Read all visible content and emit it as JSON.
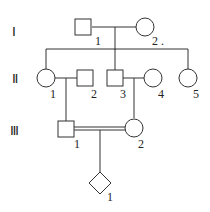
{
  "generations": {
    "g1": "Ⅰ",
    "g2": "Ⅱ",
    "g3": "Ⅲ"
  },
  "individuals": {
    "I_1": {
      "label": "1",
      "sex": "male"
    },
    "I_2": {
      "label": "2",
      "sex": "female"
    },
    "II_1": {
      "label": "1",
      "sex": "female"
    },
    "II_2": {
      "label": "2",
      "sex": "male"
    },
    "II_3": {
      "label": "3",
      "sex": "male"
    },
    "II_4": {
      "label": "4",
      "sex": "female"
    },
    "II_5": {
      "label": "5",
      "sex": "female"
    },
    "III_1": {
      "label": "1",
      "sex": "male"
    },
    "III_2": {
      "label": "2",
      "sex": "female"
    },
    "IV_1": {
      "label": "1",
      "sex": "unknown"
    }
  },
  "annotations": {
    "dot": "."
  }
}
